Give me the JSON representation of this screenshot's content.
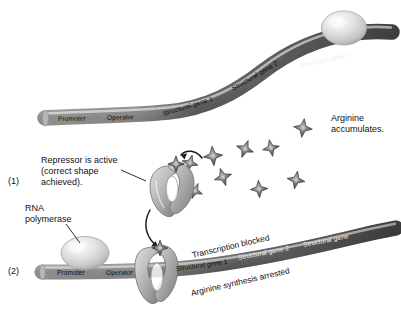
{
  "figure": {
    "background_color": "#ffffff",
    "ink_color": "#1a1a1a"
  },
  "steps": [
    {
      "id": "step-1",
      "marker": "(1)"
    },
    {
      "id": "step-2",
      "marker": "(2)"
    }
  ],
  "callouts": {
    "repressor_active": {
      "line1": "Repressor is active",
      "line2": "(correct shape",
      "line3": "achieved)."
    },
    "rna_polymerase": {
      "line1": "RNA",
      "line2": "polymerase"
    },
    "arginine_accumulates": {
      "line1": "Arginine",
      "line2": "accumulates."
    },
    "transcription_blocked": "Transcription blocked",
    "arginine_synthesis_arrested": "Arginine synthesis arrested"
  },
  "top_strand": {
    "name": "operon-dna-top",
    "segments": [
      {
        "label": "Promoter"
      },
      {
        "label": "Operator"
      },
      {
        "label": "Structural gene 1"
      },
      {
        "label": "Structural gene 2"
      },
      {
        "label": "Structural gene 3"
      }
    ]
  },
  "bottom_strand": {
    "name": "operon-dna-bottom",
    "segments": [
      {
        "label": "Promoter"
      },
      {
        "label": "Operator"
      },
      {
        "label": "Structural gene 1"
      },
      {
        "label": "Structural gene 2"
      },
      {
        "label": "Structural gene"
      }
    ]
  },
  "molecules": {
    "arginine_star_count": 9,
    "arginine_color": "#5a5a5a",
    "repressor_color": "#9a9a9a",
    "polymerase_color": "#c9c9c9",
    "dna_color_light": "#cfcfcf",
    "dna_color_dark": "#4a4a4a"
  }
}
